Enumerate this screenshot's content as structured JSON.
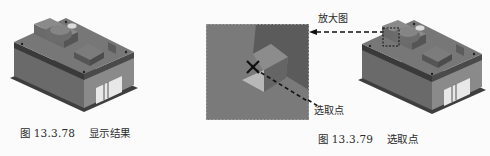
{
  "figures": [
    {
      "id": "fig-13.3.78",
      "caption_number": "图 13.3.78",
      "caption_title": "显示结果",
      "content": "mold-assembly-shaded-model"
    },
    {
      "id": "zoom-panel",
      "content": "magnified-view-with-crosshair",
      "crosshair_icon": "crosshair-icon"
    },
    {
      "id": "fig-13.3.79",
      "caption_number": "图 13.3.79",
      "caption_title": "选取点",
      "content": "mold-assembly-with-selection-box"
    }
  ],
  "callouts": {
    "magnified_view": "放大图",
    "selected_point": "选取点"
  },
  "colors": {
    "page_background": "#fbfbfb",
    "panel_background": "#7a7a7a",
    "panel_dark_wedge": "#5b5b5b",
    "model_top": "#6e6e6e",
    "model_side": "#5a5a5a",
    "leader_line": "#111111"
  }
}
